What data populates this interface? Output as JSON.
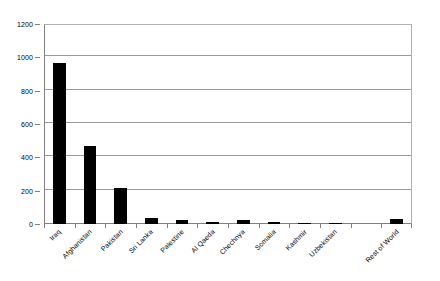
{
  "chart_data": {
    "type": "bar",
    "title": "",
    "subtitle": "",
    "xlabel": "",
    "ylabel": "",
    "categories": [
      "Iraq",
      "Afghanistan",
      "Pakistan",
      "Sri Lanka",
      "Palestine",
      "Al Qaeda",
      "Chechnya",
      "Somalia",
      "Kashmir",
      "Uzbekistan",
      "",
      "Rest of World"
    ],
    "values": [
      965,
      470,
      215,
      37,
      27,
      15,
      22,
      11,
      5,
      2,
      0,
      28
    ],
    "ylim": [
      0,
      1200
    ],
    "ytick_values": [
      0,
      200,
      400,
      600,
      800,
      1000,
      1200
    ],
    "ytick_labels": [
      "0",
      "200",
      "400",
      "600",
      "800",
      "1000",
      "1200"
    ],
    "grid": true,
    "legend": false,
    "legend_position": "none",
    "bar_color": "#000000",
    "grid_color": "#9a9a9a",
    "axis_color": "#808080",
    "plot_background": "#ffffff"
  }
}
